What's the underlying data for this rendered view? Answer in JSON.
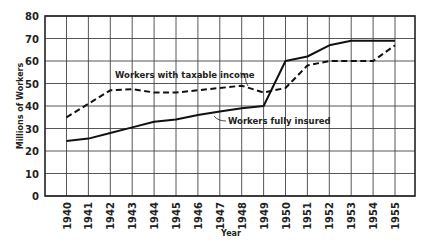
{
  "chart_data": {
    "type": "line",
    "title": "",
    "xlabel": "Year",
    "ylabel": "Millions of Workers",
    "ylim": [
      0,
      80
    ],
    "yticks": [
      0,
      10,
      20,
      30,
      40,
      50,
      60,
      70,
      80
    ],
    "grid": true,
    "legend": "inline annotations",
    "x": [
      1940,
      1941,
      1942,
      1943,
      1944,
      1945,
      1946,
      1947,
      1948,
      1949,
      1950,
      1951,
      1952,
      1953,
      1954,
      1955
    ],
    "series": [
      {
        "name": "Workers with taxable income",
        "style": "dashed",
        "values": [
          35,
          41,
          47,
          47.5,
          46,
          46,
          47,
          48,
          49,
          46,
          48,
          58,
          60,
          60,
          60,
          67
        ]
      },
      {
        "name": "Workers fully insured",
        "style": "solid",
        "values": [
          24.5,
          25.5,
          28,
          30.5,
          33,
          34,
          36,
          37.5,
          39,
          40,
          60,
          62,
          67,
          69,
          69,
          69
        ]
      }
    ],
    "annotations": [
      {
        "text": "Workers with taxable income",
        "series": "Workers with taxable income"
      },
      {
        "text": "Workers fully insured",
        "series": "Workers fully insured"
      }
    ]
  },
  "labels": {
    "xlabel": "Year",
    "ylabel": "Millions of Workers",
    "annot_taxable": "Workers with taxable income",
    "annot_insured": "Workers fully insured"
  }
}
